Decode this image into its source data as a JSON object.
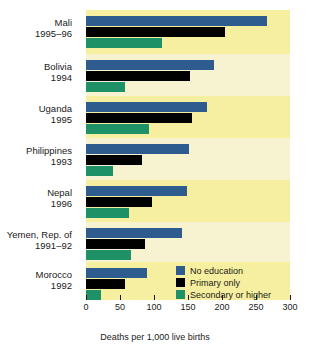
{
  "chart_data": {
    "type": "bar",
    "orientation": "horizontal",
    "title": "",
    "subtitle": "",
    "xlabel": "Deaths per 1,000 live births",
    "ylabel": "",
    "xlim": [
      0,
      300
    ],
    "xticks": [
      0,
      50,
      100,
      150,
      200,
      250,
      300
    ],
    "xticklabels": [
      "0",
      "50",
      "100",
      "150",
      "200",
      "250",
      "300"
    ],
    "grid": false,
    "legend_position": "inside-bottom-right",
    "categories": [
      {
        "name": "Mali",
        "year": "1995–96"
      },
      {
        "name": "Bolivia",
        "year": "1994"
      },
      {
        "name": "Uganda",
        "year": "1995"
      },
      {
        "name": "Philippines",
        "year": "1993"
      },
      {
        "name": "Nepal",
        "year": "1996"
      },
      {
        "name": "Yemen, Rep. of",
        "year": "1991–92"
      },
      {
        "name": "Morocco",
        "year": "1992"
      }
    ],
    "series": [
      {
        "name": "No education",
        "color": "#2f5c8f",
        "values": [
          266,
          188,
          178,
          151,
          148,
          141,
          90
        ]
      },
      {
        "name": "Primary only",
        "color": "#000000",
        "values": [
          204,
          153,
          156,
          82,
          97,
          87,
          58
        ]
      },
      {
        "name": "Secondary or higher",
        "color": "#1f9167",
        "values": [
          112,
          57,
          93,
          40,
          63,
          66,
          22
        ]
      }
    ]
  },
  "legend": {
    "items": [
      {
        "label": "No education",
        "color": "#2f5c8f"
      },
      {
        "label": "Primary only",
        "color": "#000000"
      },
      {
        "label": "Secondary or higher",
        "color": "#1f9167"
      }
    ]
  },
  "colors": {
    "band_light": "#f7f2cf",
    "band_dark": "#f6ef9f",
    "background": "#ffffff",
    "text": "#1a1a1a"
  }
}
